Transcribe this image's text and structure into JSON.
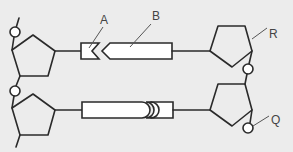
{
  "diagram": {
    "colors": {
      "background": "#ececec",
      "line": "#2a2a2a",
      "fill": "#ffffff",
      "label": "#444444"
    },
    "labels": {
      "A": "A",
      "B": "B",
      "R": "R",
      "Q": "Q"
    },
    "components": [
      {
        "id": "sugar-top-left",
        "shape": "pentagon"
      },
      {
        "id": "sugar-bottom-left",
        "shape": "pentagon"
      },
      {
        "id": "sugar-top-right",
        "shape": "pentagon"
      },
      {
        "id": "sugar-bottom-right",
        "shape": "pentagon"
      },
      {
        "id": "phosphate-top-left",
        "shape": "circle"
      },
      {
        "id": "phosphate-mid-left",
        "shape": "circle"
      },
      {
        "id": "phosphate-mid-right",
        "shape": "circle"
      },
      {
        "id": "phosphate-bottom-right",
        "shape": "circle",
        "label": "Q"
      },
      {
        "id": "base-top-small",
        "shape": "chevron-notch",
        "label": "A"
      },
      {
        "id": "base-top-large",
        "shape": "chevron-arrow",
        "label": "B"
      },
      {
        "id": "base-bottom-large",
        "shape": "rounded-end"
      },
      {
        "id": "base-bottom-small",
        "shape": "double-curve-notch"
      }
    ]
  }
}
